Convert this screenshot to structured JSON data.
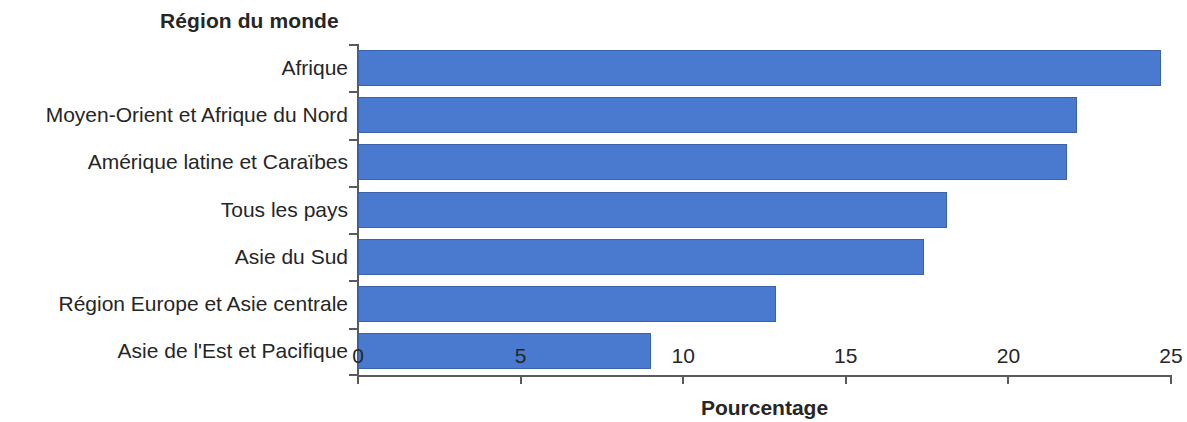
{
  "chart_data": {
    "type": "bar",
    "orientation": "horizontal",
    "title": "",
    "ylabel": "Région du monde",
    "xlabel": "Pourcentage",
    "xlim": [
      0,
      25
    ],
    "xticks": [
      "0",
      "5",
      "10",
      "15",
      "20",
      "25"
    ],
    "xtick_values": [
      0,
      5,
      10,
      15,
      20,
      25
    ],
    "grid": false,
    "legend": null,
    "bar_color": "#4a7ad0",
    "bar_edge_color": "#3a63ab",
    "categories": [
      "Afrique",
      "Moyen-Orient et Afrique du Nord",
      "Amérique latine et Caraïbes",
      "Tous les pays",
      "Asie du Sud",
      "Région Europe et Asie centrale",
      "Asie de l'Est et Pacifique"
    ],
    "values": [
      24.7,
      22.1,
      21.8,
      18.1,
      17.4,
      12.85,
      9.0
    ]
  }
}
